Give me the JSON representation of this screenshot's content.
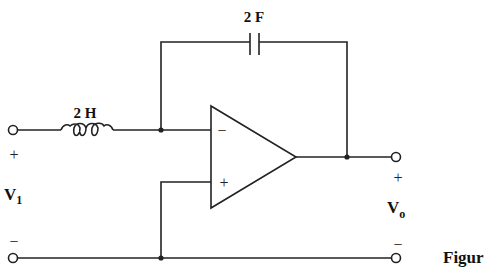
{
  "diagram": {
    "type": "op-amp circuit",
    "components": {
      "inductor": {
        "label": "2 H"
      },
      "capacitor": {
        "label": "2 F"
      },
      "opamp": {
        "inverting_sign": "−",
        "noninverting_sign": "+"
      }
    },
    "input": {
      "label": "V",
      "subscript": "1",
      "plus": "+",
      "minus": "−"
    },
    "output": {
      "label": "V",
      "subscript": "o",
      "plus": "+",
      "minus": "−"
    },
    "caption": "Figur"
  }
}
